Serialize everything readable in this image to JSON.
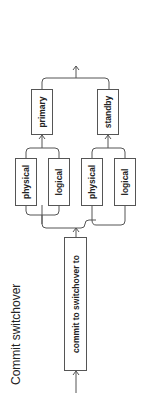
{
  "diagram": {
    "title": "Commit switchover",
    "orientation": "rotated-90-ccw",
    "entry": {
      "label": "commit to switchover to"
    },
    "branches": [
      {
        "target": "primary",
        "options": [
          "physical",
          "logical"
        ]
      },
      {
        "target": "standby",
        "options": [
          "physical",
          "logical"
        ]
      }
    ],
    "colors": {
      "stroke": "#555555",
      "text": "#222222",
      "background": "#ffffff"
    }
  }
}
